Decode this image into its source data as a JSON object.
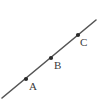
{
  "figure": {
    "background_color": "#ffffff",
    "line_color": "#555555",
    "point_color": "#2b2b2b",
    "label_color": "#3a3a3a"
  },
  "chart_data": {
    "type": "scatter",
    "title": "",
    "subtitle": "",
    "xlabel": "",
    "ylabel": "",
    "grid": false,
    "legend": null,
    "axis_visible": false,
    "xlim": [
      0,
      100
    ],
    "ylim": [
      0,
      101
    ],
    "line": {
      "name": "line-through-ABC",
      "x": [
        2,
        96
      ],
      "y": [
        98,
        20
      ],
      "stroke": "#555555",
      "stroke_width": 1.6
    },
    "points": [
      {
        "label": "A",
        "x": 26,
        "y": 79,
        "label_x": 29,
        "label_y": 81
      },
      {
        "label": "B",
        "x": 51,
        "y": 58,
        "label_x": 54,
        "label_y": 60
      },
      {
        "label": "C",
        "x": 78,
        "y": 35,
        "label_x": 80,
        "label_y": 37
      }
    ],
    "labels": [
      "A",
      "B",
      "C"
    ],
    "values": [
      79,
      58,
      35
    ]
  }
}
